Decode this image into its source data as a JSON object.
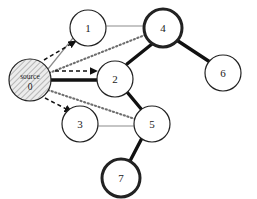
{
  "figure": {
    "background": "#ffffff",
    "width": 257,
    "height": 199
  },
  "style": {
    "thin_edge_color": "#8c8c8c",
    "thick_edge_color": "#111111",
    "dotted_edge_color": "#6e6e6e",
    "dashed_arrow_color": "#111111",
    "node_fill": "#ffffff",
    "node_stroke": "#222222",
    "source_hatch_color": "#777777",
    "source_fill": "#e8e8e8",
    "label_color": "#1a1a1a"
  },
  "nodes": [
    {
      "id": "0",
      "label_line1": "source",
      "label_line2": "0",
      "cx": 30,
      "cy": 80,
      "r": 21,
      "border": "thin",
      "fill": "hatched"
    },
    {
      "id": "1",
      "label_line1": "1",
      "label_line2": "",
      "cx": 88,
      "cy": 28,
      "r": 18,
      "border": "thin",
      "fill": "white"
    },
    {
      "id": "2",
      "label_line1": "2",
      "label_line2": "",
      "cx": 115,
      "cy": 79,
      "r": 18,
      "border": "thin",
      "fill": "white"
    },
    {
      "id": "3",
      "label_line1": "3",
      "label_line2": "",
      "cx": 80,
      "cy": 124,
      "r": 18,
      "border": "thin",
      "fill": "white"
    },
    {
      "id": "4",
      "label_line1": "4",
      "label_line2": "",
      "cx": 163,
      "cy": 28,
      "r": 19,
      "border": "thick",
      "fill": "white"
    },
    {
      "id": "5",
      "label_line1": "5",
      "label_line2": "",
      "cx": 152,
      "cy": 124,
      "r": 18,
      "border": "thin",
      "fill": "white"
    },
    {
      "id": "6",
      "label_line1": "6",
      "label_line2": "",
      "cx": 223,
      "cy": 73,
      "r": 18,
      "border": "thin",
      "fill": "white"
    },
    {
      "id": "7",
      "label_line1": "7",
      "label_line2": "",
      "cx": 121,
      "cy": 178,
      "r": 19,
      "border": "thick",
      "fill": "white"
    }
  ],
  "edges": [
    {
      "from": "0",
      "to": "1",
      "style": "thin-solid",
      "x1": 48,
      "y1": 69,
      "x2": 73,
      "y2": 38
    },
    {
      "from": "1",
      "to": "4",
      "style": "thin-solid",
      "x1": 106,
      "y1": 26,
      "x2": 144,
      "y2": 26
    },
    {
      "from": "3",
      "to": "5",
      "style": "thin-solid",
      "x1": 98,
      "y1": 126,
      "x2": 134,
      "y2": 126
    },
    {
      "from": "0",
      "to": "2",
      "style": "thick-solid",
      "x1": 51,
      "y1": 80,
      "x2": 97,
      "y2": 80
    },
    {
      "from": "2",
      "to": "4",
      "style": "thick-solid",
      "x1": 127,
      "y1": 64,
      "x2": 152,
      "y2": 44
    },
    {
      "from": "2",
      "to": "5",
      "style": "thick-solid",
      "x1": 127,
      "y1": 92,
      "x2": 142,
      "y2": 110
    },
    {
      "from": "4",
      "to": "6",
      "style": "thick-solid",
      "x1": 178,
      "y1": 41,
      "x2": 210,
      "y2": 62
    },
    {
      "from": "5",
      "to": "7",
      "style": "thick-solid",
      "x1": 142,
      "y1": 138,
      "x2": 130,
      "y2": 161
    },
    {
      "from": "0",
      "to": "4",
      "style": "dotted",
      "x1": 49,
      "y1": 73,
      "x2": 145,
      "y2": 35
    },
    {
      "from": "0",
      "to": "5",
      "style": "dotted",
      "x1": 48,
      "y1": 90,
      "x2": 135,
      "y2": 119
    }
  ],
  "arrows": [
    {
      "label": "arrow-to-1",
      "x1": 44,
      "y1": 60,
      "x2": 76,
      "y2": 41
    },
    {
      "label": "arrow-to-2",
      "x1": 55,
      "y1": 71,
      "x2": 97,
      "y2": 71
    },
    {
      "label": "arrow-to-3",
      "x1": 45,
      "y1": 98,
      "x2": 72,
      "y2": 112
    }
  ]
}
